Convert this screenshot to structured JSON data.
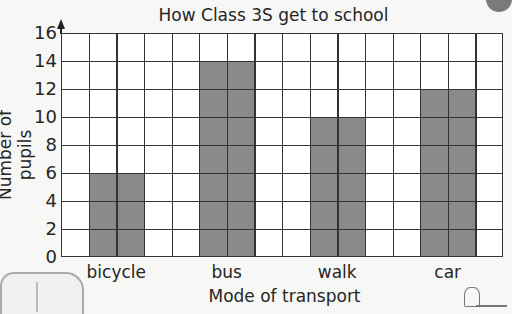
{
  "chart_data": {
    "type": "bar",
    "title": "How Class 3S get to school",
    "xlabel": "Mode of transport",
    "ylabel": "Number of pupils",
    "categories": [
      "bicycle",
      "bus",
      "walk",
      "car"
    ],
    "values": [
      6,
      14,
      10,
      12
    ],
    "ylim": [
      0,
      16
    ],
    "yticks": [
      0,
      2,
      4,
      6,
      8,
      10,
      12,
      14,
      16
    ],
    "grid": true,
    "bar_color": "#8a8a8a",
    "grid_columns": 16
  },
  "decorations": [
    "bus-illustration",
    "ball-illustration",
    "cyclist-illustration"
  ]
}
